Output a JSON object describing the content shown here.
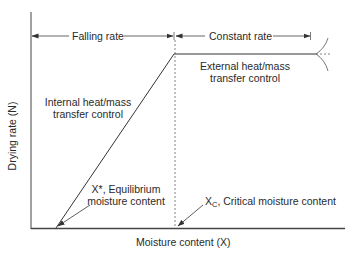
{
  "diagram": {
    "type": "drying-rate-curve",
    "axes": {
      "ylabel": "Drying rate (N)",
      "xlabel": "Moisture content (X)"
    },
    "regions": {
      "falling": "Falling rate",
      "constant": "Constant rate"
    },
    "annotations": {
      "internal_line1": "Internal heat/mass",
      "internal_line2": "transfer control",
      "external_line1": "External heat/mass",
      "external_line2": "transfer control",
      "equilibrium_line1": "X*, Equilibrium",
      "equilibrium_line2": "moisture content",
      "critical_symbol": "X",
      "critical_sub": "C",
      "critical_text": ", Critical moisture content"
    },
    "colors": {
      "line": "#333333",
      "text": "#2a2a2a"
    }
  }
}
